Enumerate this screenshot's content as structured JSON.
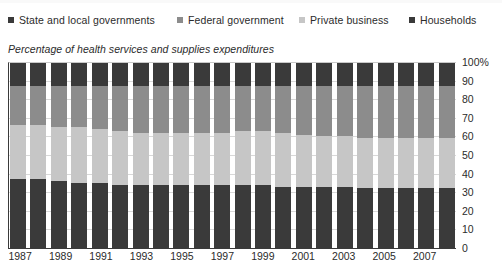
{
  "legend": {
    "items": [
      {
        "label": "State and local governments",
        "color": "#3a3a3a",
        "icon": "square-marker-icon"
      },
      {
        "label": "Federal government",
        "color": "#8c8c8c",
        "icon": "square-marker-icon"
      },
      {
        "label": "Private business",
        "color": "#c6c6c6",
        "icon": "square-marker-icon"
      },
      {
        "label": "Households",
        "color": "#3a3a3a",
        "icon": "square-marker-icon"
      }
    ]
  },
  "subtitle": "Percentage of health services and supplies expenditures",
  "chart_data": {
    "type": "bar",
    "title": "",
    "subtitle": "Percentage of health services and supplies expenditures",
    "xlabel": "",
    "ylabel": "",
    "ylim": [
      0,
      100
    ],
    "stacked": true,
    "stack_order": "bottom-to-top",
    "grid": true,
    "legend_position": "top",
    "categories": [
      "1987",
      "1988",
      "1989",
      "1990",
      "1991",
      "1992",
      "1993",
      "1994",
      "1995",
      "1996",
      "1997",
      "1998",
      "1999",
      "2000",
      "2001",
      "2002",
      "2003",
      "2004",
      "2005",
      "2006",
      "2007",
      "2008"
    ],
    "tick_labels_x": [
      "1987",
      "1989",
      "1991",
      "1993",
      "1995",
      "1997",
      "1999",
      "2001",
      "2003",
      "2005",
      "2007"
    ],
    "tick_labels_y": [
      "0",
      "10",
      "20",
      "30",
      "40",
      "50",
      "60",
      "70",
      "80",
      "90",
      "100%"
    ],
    "tick_values_y": [
      0,
      10,
      20,
      30,
      40,
      50,
      60,
      70,
      80,
      90,
      100
    ],
    "series": [
      {
        "name": "Households",
        "color": "#3a3a3a",
        "values": [
          37,
          37,
          36,
          35,
          35,
          34,
          34,
          34,
          34,
          34,
          34,
          34,
          34,
          33,
          33,
          33,
          33,
          32,
          32,
          32,
          32,
          32
        ]
      },
      {
        "name": "Private business",
        "color": "#c6c6c6",
        "values": [
          29,
          29,
          29,
          30,
          29,
          29,
          28,
          28,
          28,
          28,
          28,
          29,
          29,
          29,
          28,
          27,
          27,
          27,
          27,
          27,
          27,
          27
        ]
      },
      {
        "name": "Federal government",
        "color": "#8c8c8c",
        "values": [
          21,
          21,
          22,
          22,
          23,
          24,
          25,
          25,
          25,
          25,
          25,
          24,
          24,
          25,
          26,
          27,
          27,
          28,
          28,
          28,
          28,
          28
        ]
      },
      {
        "name": "State and local governments",
        "color": "#3a3a3a",
        "values": [
          13,
          13,
          13,
          13,
          13,
          13,
          13,
          13,
          13,
          13,
          13,
          13,
          13,
          13,
          13,
          13,
          13,
          13,
          13,
          13,
          13,
          13
        ]
      }
    ]
  }
}
